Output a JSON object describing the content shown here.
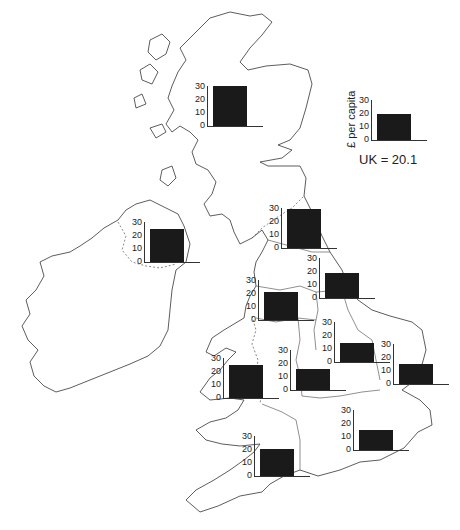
{
  "chart_data": {
    "type": "bar",
    "title": "",
    "ylabel": "£ per capita",
    "ylim": [
      0,
      30
    ],
    "yticks": [
      0,
      10,
      20,
      30
    ],
    "uk_average": 20.1,
    "uk_label": "UK = 20.1",
    "categories": [
      "Scotland",
      "Northern Ireland",
      "North",
      "Yorkshire and Humberside",
      "North West",
      "East Midlands",
      "East Anglia",
      "Wales",
      "West Midlands",
      "South East",
      "South West"
    ],
    "values": [
      30,
      25,
      29,
      19,
      21,
      14,
      15,
      25,
      16,
      15,
      20
    ]
  },
  "legend": {
    "ylabel": "£ per capita",
    "uk_label": "UK = 20.1",
    "value": 20.1,
    "ticks": [
      "30",
      "20",
      "10",
      "0"
    ]
  },
  "regions": [
    {
      "name": "Scotland",
      "value": 30,
      "x": 193,
      "y": 86,
      "ticks": [
        "30",
        "20",
        "10",
        "0"
      ]
    },
    {
      "name": "Northern Ireland",
      "value": 25,
      "x": 130,
      "y": 222,
      "ticks": [
        "30",
        "20",
        "10",
        "0"
      ]
    },
    {
      "name": "North",
      "value": 29,
      "x": 267,
      "y": 208,
      "ticks": [
        "30",
        "20",
        "10",
        "0"
      ]
    },
    {
      "name": "Yorkshire and Humberside",
      "value": 19,
      "x": 305,
      "y": 258,
      "ticks": [
        "30",
        "20",
        "10",
        "0"
      ]
    },
    {
      "name": "North West",
      "value": 21,
      "x": 244,
      "y": 280,
      "ticks": [
        "30",
        "20",
        "10",
        "0"
      ]
    },
    {
      "name": "East Midlands",
      "value": 14,
      "x": 320,
      "y": 322,
      "ticks": [
        "30",
        "20",
        "10",
        "0"
      ]
    },
    {
      "name": "East Anglia",
      "value": 15,
      "x": 379,
      "y": 344,
      "ticks": [
        "30",
        "20",
        "10",
        "0"
      ]
    },
    {
      "name": "Wales",
      "value": 25,
      "x": 209,
      "y": 358,
      "ticks": [
        "30",
        "20",
        "10",
        "0"
      ]
    },
    {
      "name": "West Midlands",
      "value": 16,
      "x": 276,
      "y": 350,
      "ticks": [
        "30",
        "20",
        "10",
        "0"
      ]
    },
    {
      "name": "South East",
      "value": 15,
      "x": 339,
      "y": 410,
      "ticks": [
        "30",
        "20",
        "10",
        "0"
      ]
    },
    {
      "name": "South West",
      "value": 20,
      "x": 240,
      "y": 436,
      "ticks": [
        "30",
        "20",
        "10",
        "0"
      ]
    }
  ]
}
